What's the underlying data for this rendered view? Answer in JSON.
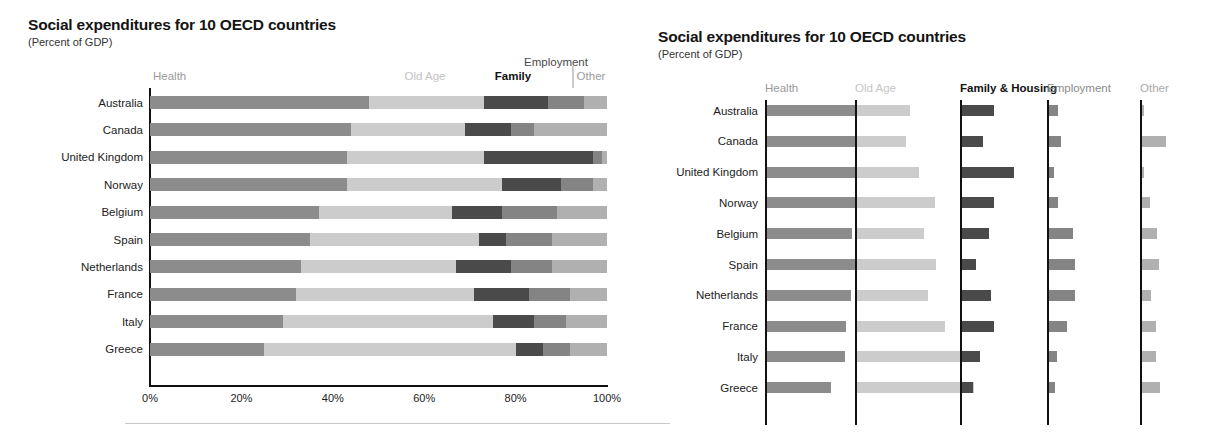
{
  "left_panel": {
    "title": "Social expenditures for 10 OECD countries",
    "subtitle": "(Percent of GDP)",
    "headers": {
      "health": "Health",
      "old_age": "Old Age",
      "family": "Family",
      "employment": "Employment",
      "other": "Other"
    }
  },
  "right_panel": {
    "title": "Social expenditures for 10 OECD countries",
    "subtitle": "(Percent of GDP)",
    "headers": {
      "health": "Health",
      "old_age": "Old Age",
      "family_housing": "Family & Housing",
      "employment": "Employment",
      "other": "Other"
    }
  },
  "colors": {
    "health": "#8c8c8c",
    "old_age": "#cccccc",
    "family": "#4a4a4a",
    "employment": "#848484",
    "other": "#b0b0b0",
    "axis": "#111111"
  },
  "chart_data": [
    {
      "type": "bar",
      "orientation": "horizontal",
      "stacked": true,
      "title": "Social expenditures for 10 OECD countries",
      "subtitle": "(Percent of GDP)",
      "xlabel": "",
      "ylabel": "",
      "xlim": [
        0,
        100
      ],
      "xticks": [
        0,
        20,
        40,
        60,
        80,
        100
      ],
      "xticklabels": [
        "0%",
        "20%",
        "40%",
        "60%",
        "80%",
        "100%"
      ],
      "grid": false,
      "legend_position": "top-inline",
      "categories": [
        "Australia",
        "Canada",
        "United Kingdom",
        "Norway",
        "Belgium",
        "Spain",
        "Netherlands",
        "France",
        "Italy",
        "Greece"
      ],
      "series": [
        {
          "name": "Health",
          "values": [
            48,
            44,
            43,
            43,
            37,
            35,
            33,
            32,
            29,
            25
          ]
        },
        {
          "name": "Old Age",
          "values": [
            25,
            25,
            30,
            34,
            29,
            37,
            34,
            39,
            46,
            55
          ]
        },
        {
          "name": "Family",
          "values": [
            14,
            10,
            24,
            13,
            11,
            6,
            12,
            12,
            9,
            6
          ]
        },
        {
          "name": "Employment",
          "values": [
            8,
            5,
            2,
            7,
            12,
            10,
            9,
            9,
            7,
            6
          ]
        },
        {
          "name": "Other",
          "values": [
            5,
            16,
            1,
            3,
            11,
            12,
            12,
            8,
            9,
            8
          ]
        }
      ]
    },
    {
      "type": "bar",
      "orientation": "horizontal",
      "stacked": false,
      "small_multiples": true,
      "title": "Social expenditures for 10 OECD countries",
      "subtitle": "(Percent of GDP)",
      "grid": false,
      "legend_position": "column-headers",
      "categories": [
        "Australia",
        "Canada",
        "United Kingdom",
        "Norway",
        "Belgium",
        "Spain",
        "Netherlands",
        "France",
        "Italy",
        "Greece"
      ],
      "panels": [
        {
          "name": "Health",
          "values": [
            6.3,
            6.1,
            6.2,
            6.5,
            5.6,
            5.9,
            5.5,
            5.2,
            5.1,
            4.2
          ]
        },
        {
          "name": "Old Age",
          "values": [
            3.5,
            3.2,
            4.1,
            5.1,
            4.4,
            5.2,
            4.7,
            5.8,
            7.0,
            7.7
          ]
        },
        {
          "name": "Family & Housing",
          "values": [
            2.1,
            1.4,
            3.4,
            2.1,
            1.8,
            0.9,
            1.9,
            2.1,
            1.2,
            0.7
          ]
        },
        {
          "name": "Employment",
          "values": [
            0.6,
            0.8,
            0.3,
            0.6,
            1.6,
            1.7,
            1.7,
            1.2,
            0.5,
            0.4
          ]
        },
        {
          "name": "Other",
          "values": [
            0.1,
            1.6,
            0.1,
            0.5,
            1.0,
            1.1,
            0.6,
            0.9,
            0.9,
            1.2
          ]
        }
      ]
    }
  ]
}
